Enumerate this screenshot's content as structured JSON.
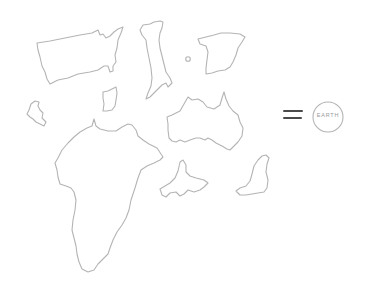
{
  "illustration": {
    "style": "hand-drawn pencil outlines",
    "stroke_color": "#b4b4b4",
    "background": "#ffffff",
    "shapes": [
      {
        "id": "usa",
        "name": "United States outline"
      },
      {
        "id": "italy",
        "name": "Italy outline"
      },
      {
        "id": "spain",
        "name": "Iberian peninsula outline"
      },
      {
        "id": "small-dot-island",
        "name": "Small island"
      },
      {
        "id": "sardinia",
        "name": "Sardinia outline"
      },
      {
        "id": "ireland",
        "name": "Small island outline (left)"
      },
      {
        "id": "africa",
        "name": "Africa outline"
      },
      {
        "id": "australia",
        "name": "Australia outline"
      },
      {
        "id": "japan-fragment",
        "name": "Island fragment"
      },
      {
        "id": "new-zealand",
        "name": "Island outline (right)"
      }
    ],
    "operator": "=",
    "operator_color": "#4a4a4a",
    "result": {
      "label": "EARTH",
      "shape": "circle"
    }
  }
}
